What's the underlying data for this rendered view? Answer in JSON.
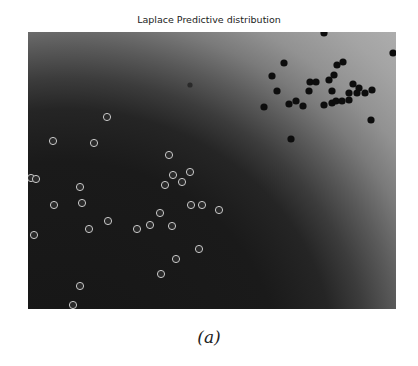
{
  "title": "Laplace Predictive distribution",
  "caption": "(a)",
  "chart_data": {
    "type": "scatter",
    "title": "Laplace Predictive distribution",
    "xlabel": "",
    "ylabel": "",
    "axes_visible": false,
    "grid": false,
    "background": "predictive probability contour (dark lower-left to light upper-right)",
    "plot_box_px": {
      "left": 28,
      "top": 32,
      "right": 396,
      "bottom": 309
    },
    "series": [
      {
        "name": "class-1",
        "marker": "filled black circle",
        "color": "#111111",
        "points_px": [
          [
            324,
            33
          ],
          [
            393,
            53
          ],
          [
            284,
            63
          ],
          [
            337,
            65
          ],
          [
            343,
            62
          ],
          [
            272,
            76
          ],
          [
            310,
            82
          ],
          [
            316,
            82
          ],
          [
            329,
            80
          ],
          [
            334,
            75
          ],
          [
            277,
            91
          ],
          [
            309,
            91
          ],
          [
            332,
            91
          ],
          [
            353,
            84
          ],
          [
            359,
            88
          ],
          [
            372,
            90
          ],
          [
            365,
            93
          ],
          [
            357,
            93
          ],
          [
            349,
            93
          ],
          [
            264,
            107
          ],
          [
            289,
            104
          ],
          [
            296,
            101
          ],
          [
            303,
            106
          ],
          [
            324,
            105
          ],
          [
            332,
            103
          ],
          [
            336,
            101
          ],
          [
            342,
            101
          ],
          [
            349,
            100
          ],
          [
            371,
            120
          ],
          [
            291,
            139
          ],
          [
            190,
            85
          ]
        ]
      },
      {
        "name": "class-0",
        "marker": "hollow white-edged circle",
        "color": "#d0d0d0",
        "points_px": [
          [
            107,
            117
          ],
          [
            53,
            141
          ],
          [
            94,
            143
          ],
          [
            31,
            178
          ],
          [
            36,
            179
          ],
          [
            80,
            187
          ],
          [
            54,
            205
          ],
          [
            82,
            203
          ],
          [
            108,
            221
          ],
          [
            89,
            229
          ],
          [
            34,
            235
          ],
          [
            80,
            286
          ],
          [
            73,
            305
          ],
          [
            169,
            155
          ],
          [
            190,
            172
          ],
          [
            173,
            175
          ],
          [
            182,
            182
          ],
          [
            165,
            185
          ],
          [
            191,
            205
          ],
          [
            202,
            205
          ],
          [
            219,
            210
          ],
          [
            160,
            213
          ],
          [
            150,
            225
          ],
          [
            172,
            226
          ],
          [
            137,
            229
          ],
          [
            199,
            249
          ],
          [
            176,
            259
          ],
          [
            161,
            274
          ]
        ]
      }
    ]
  }
}
